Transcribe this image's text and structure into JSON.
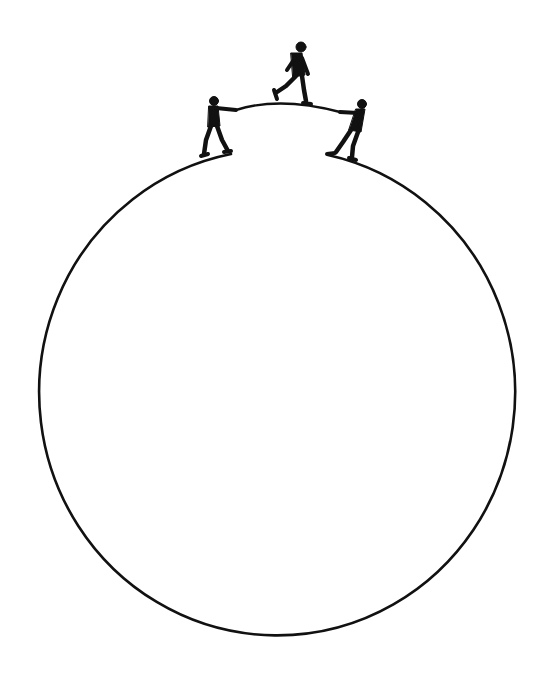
{
  "illustration": {
    "description": "Three figures on top of a large circle: two hold a rope bridging a gap at the top of the circle while a third walks across it",
    "colors": {
      "background": "#ffffff",
      "ink": "#111111"
    },
    "circle": {
      "cx": 273,
      "cy": 400,
      "rx": 238,
      "ry": 243,
      "gap_left_x": 231,
      "gap_right_x": 328
    },
    "rope": {
      "start": [
        236,
        110
      ],
      "peak": [
        278,
        102
      ],
      "end": [
        340,
        112
      ]
    },
    "figures": [
      {
        "role": "left-holder",
        "x": 214,
        "y": 130
      },
      {
        "role": "walker",
        "x": 294,
        "y": 72
      },
      {
        "role": "right-holder",
        "x": 348,
        "y": 130
      }
    ]
  }
}
